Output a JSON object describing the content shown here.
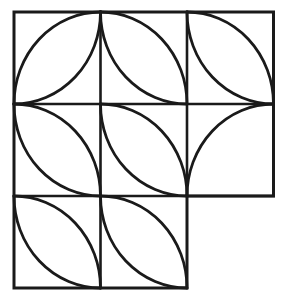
{
  "figure": {
    "type": "geometric-line-drawing",
    "canvas": {
      "width": 286,
      "height": 302,
      "background": "#ffffff"
    },
    "stroke": {
      "color": "#1a1a1a",
      "outer_width": 3.0,
      "grid_width": 2.6,
      "arc_width": 2.8
    },
    "grid": {
      "origin_x": 14,
      "origin_y": 12,
      "cell_w": 86.5,
      "cell_h": 92,
      "cols": 3,
      "rows": 3,
      "x_lines": [
        14,
        100.5,
        187,
        273.5
      ],
      "y_lines": [
        12,
        104,
        196,
        288
      ],
      "missing_cell": {
        "col": 2,
        "row": 2
      },
      "present_cells": [
        {
          "col": 0,
          "row": 0
        },
        {
          "col": 1,
          "row": 0
        },
        {
          "col": 2,
          "row": 0
        },
        {
          "col": 0,
          "row": 1
        },
        {
          "col": 1,
          "row": 1
        },
        {
          "col": 2,
          "row": 1
        },
        {
          "col": 0,
          "row": 2
        },
        {
          "col": 1,
          "row": 2
        }
      ]
    },
    "outline_path": "M 14 12 L 273.5 12 L 273.5 196 L 187 196 L 187 288 L 14 288 Z",
    "grid_segments": [
      {
        "name": "vertical-x1-top",
        "x1": 100.5,
        "y1": 12,
        "x2": 100.5,
        "y2": 288
      },
      {
        "name": "vertical-x2",
        "x1": 187,
        "y1": 12,
        "x2": 187,
        "y2": 196
      },
      {
        "name": "horizontal-y1",
        "x1": 14,
        "y1": 104,
        "x2": 273.5,
        "y2": 104
      },
      {
        "name": "horizontal-y2",
        "x1": 14,
        "y1": 196,
        "x2": 273.5,
        "y2": 196
      }
    ],
    "arcs": [
      {
        "name": "arc-r0c0-center-tl",
        "cell": "top-left",
        "center": "top-left",
        "from": [
          100.5,
          12
        ],
        "to": [
          14,
          104
        ],
        "sweep": 1
      },
      {
        "name": "arc-r0c0-center-br",
        "cell": "top-left",
        "center": "bottom-right",
        "from": [
          100.5,
          12
        ],
        "to": [
          14,
          104
        ],
        "sweep": 0
      },
      {
        "name": "arc-r0c1-center-bl",
        "cell": "top-middle",
        "center": "bottom-left",
        "from": [
          100.5,
          12
        ],
        "to": [
          187,
          104
        ],
        "sweep": 1
      },
      {
        "name": "arc-r0c1-center-tr",
        "cell": "top-middle",
        "center": "top-right",
        "from": [
          100.5,
          12
        ],
        "to": [
          187,
          104
        ],
        "sweep": 0
      },
      {
        "name": "arc-r0c2-center-bl",
        "cell": "top-right",
        "center": "bottom-left",
        "from": [
          187,
          12
        ],
        "to": [
          273.5,
          104
        ],
        "sweep": 1
      },
      {
        "name": "arc-r0c2-center-br",
        "cell": "top-right",
        "center": "bottom-right",
        "from": [
          187,
          12
        ],
        "to": [
          273.5,
          104
        ],
        "sweep": 0
      },
      {
        "name": "arc-r1c0-center-tr",
        "cell": "middle-left",
        "center": "top-right",
        "from": [
          14,
          104
        ],
        "to": [
          100.5,
          196
        ],
        "sweep": 0
      },
      {
        "name": "arc-r1c0-center-bl",
        "cell": "middle-left",
        "center": "bottom-left",
        "from": [
          14,
          104
        ],
        "to": [
          100.5,
          196
        ],
        "sweep": 1
      },
      {
        "name": "arc-r1c1-center-tr",
        "cell": "middle-center",
        "center": "top-right",
        "from": [
          100.5,
          104
        ],
        "to": [
          187,
          196
        ],
        "sweep": 0
      },
      {
        "name": "arc-r1c1-center-bl",
        "cell": "middle-center",
        "center": "bottom-left",
        "from": [
          100.5,
          104
        ],
        "to": [
          187,
          196
        ],
        "sweep": 1
      },
      {
        "name": "arc-r1c2-center-bl",
        "cell": "middle-right",
        "center": "bottom-left",
        "from": [
          187,
          196
        ],
        "to": [
          273.5,
          104
        ],
        "sweep": 1
      },
      {
        "name": "arc-r2c0-center-tr",
        "cell": "bottom-left",
        "center": "top-right",
        "from": [
          14,
          196
        ],
        "to": [
          100.5,
          288
        ],
        "sweep": 0
      },
      {
        "name": "arc-r2c0-center-bl",
        "cell": "bottom-left",
        "center": "bottom-left",
        "from": [
          14,
          196
        ],
        "to": [
          100.5,
          288
        ],
        "sweep": 1
      },
      {
        "name": "arc-r2c1-center-tl",
        "cell": "bottom-middle",
        "center": "top-left",
        "from": [
          100.5,
          196
        ],
        "to": [
          187,
          288
        ],
        "sweep": 0
      },
      {
        "name": "arc-r2c1-center-tr",
        "cell": "bottom-middle",
        "center": "top-right",
        "from": [
          100.5,
          196
        ],
        "to": [
          187,
          288
        ],
        "sweep": 1
      }
    ]
  }
}
